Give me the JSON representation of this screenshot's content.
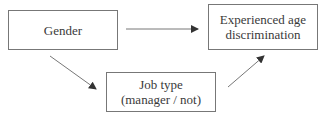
{
  "diagram": {
    "nodes": {
      "gender": {
        "lines": [
          "Gender"
        ]
      },
      "age_discrimination": {
        "lines": [
          "Experienced age",
          "discrimination"
        ]
      },
      "job_type": {
        "lines": [
          "Job type",
          "(manager / not)"
        ]
      }
    },
    "edges": [
      {
        "from": "gender",
        "to": "age_discrimination"
      },
      {
        "from": "gender",
        "to": "job_type"
      },
      {
        "from": "job_type",
        "to": "age_discrimination"
      }
    ],
    "colors": {
      "line": "#777777",
      "text": "#3a3a3a"
    }
  }
}
